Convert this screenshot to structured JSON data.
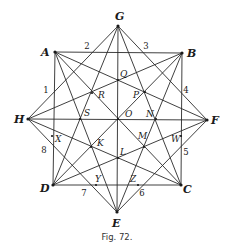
{
  "figure": {
    "caption": "Fig. 72.",
    "vertices": [
      {
        "id": "G",
        "label": "G",
        "x": 118,
        "y": 26,
        "lx": 115,
        "ly": 20
      },
      {
        "id": "A",
        "label": "A",
        "x": 55,
        "y": 52,
        "lx": 41,
        "ly": 56
      },
      {
        "id": "B",
        "label": "B",
        "x": 182,
        "y": 53,
        "lx": 187,
        "ly": 57
      },
      {
        "id": "H",
        "label": "H",
        "x": 28,
        "y": 119,
        "lx": 14,
        "ly": 123
      },
      {
        "id": "F",
        "label": "F",
        "x": 207,
        "y": 120,
        "lx": 211,
        "ly": 124
      },
      {
        "id": "D",
        "label": "D",
        "x": 53,
        "y": 185,
        "lx": 40,
        "ly": 192
      },
      {
        "id": "C",
        "label": "C",
        "x": 181,
        "y": 185,
        "lx": 183,
        "ly": 193
      },
      {
        "id": "E",
        "label": "E",
        "x": 117,
        "y": 212,
        "lx": 112,
        "ly": 227
      }
    ],
    "edges": [
      [
        "A",
        "B"
      ],
      [
        "B",
        "C"
      ],
      [
        "C",
        "D"
      ],
      [
        "D",
        "A"
      ],
      [
        "G",
        "H"
      ],
      [
        "G",
        "D"
      ],
      [
        "G",
        "E"
      ],
      [
        "G",
        "C"
      ],
      [
        "G",
        "F"
      ],
      [
        "H",
        "B"
      ],
      [
        "H",
        "F"
      ],
      [
        "H",
        "C"
      ],
      [
        "H",
        "E"
      ],
      [
        "A",
        "F"
      ],
      [
        "A",
        "E"
      ],
      [
        "A",
        "C"
      ],
      [
        "B",
        "D"
      ],
      [
        "B",
        "E"
      ],
      [
        "F",
        "D"
      ],
      [
        "F",
        "E"
      ],
      [
        "E",
        "H"
      ]
    ],
    "interior_points": [
      {
        "label": "Q",
        "x": 118,
        "y": 80,
        "lx": 120,
        "ly": 77
      },
      {
        "label": "R",
        "x": 92,
        "y": 93,
        "lx": 98,
        "ly": 98
      },
      {
        "label": "P",
        "x": 145,
        "y": 92,
        "lx": 133,
        "ly": 98
      },
      {
        "label": "S",
        "x": 80,
        "y": 119,
        "lx": 84,
        "ly": 116
      },
      {
        "label": "O",
        "x": 118,
        "y": 119,
        "lx": 125,
        "ly": 117
      },
      {
        "label": "N",
        "x": 156,
        "y": 119,
        "lx": 146,
        "ly": 117
      },
      {
        "label": "X",
        "x": 52,
        "y": 136,
        "lx": 55,
        "ly": 142
      },
      {
        "label": "K",
        "x": 91,
        "y": 147,
        "lx": 97,
        "ly": 146
      },
      {
        "label": "M",
        "x": 144,
        "y": 147,
        "lx": 138,
        "ly": 139
      },
      {
        "label": "W",
        "x": 181,
        "y": 136,
        "lx": 171,
        "ly": 142
      },
      {
        "label": "L",
        "x": 118,
        "y": 158,
        "lx": 120,
        "ly": 155
      },
      {
        "label": "Y",
        "x": 96,
        "y": 185,
        "lx": 95,
        "ly": 182
      },
      {
        "label": "Z",
        "x": 138,
        "y": 185,
        "lx": 130,
        "ly": 182
      }
    ],
    "side_numbers": [
      {
        "label": "1",
        "x": 46,
        "y": 93
      },
      {
        "label": "2",
        "x": 87,
        "y": 49
      },
      {
        "label": "3",
        "x": 146,
        "y": 49
      },
      {
        "label": "4",
        "x": 186,
        "y": 93
      },
      {
        "label": "5",
        "x": 186,
        "y": 155
      },
      {
        "label": "6",
        "x": 142,
        "y": 196
      },
      {
        "label": "7",
        "x": 84,
        "y": 196
      },
      {
        "label": "8",
        "x": 44,
        "y": 153
      }
    ]
  }
}
